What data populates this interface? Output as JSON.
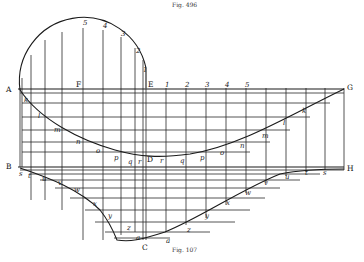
{
  "figure": {
    "caption_top": "Fig. 496",
    "caption_bottom": "Fig. 107",
    "points": {
      "A": "A",
      "B": "B",
      "C": "C",
      "D": "D",
      "E": "E",
      "F": "F",
      "G": "G",
      "H": "H"
    },
    "circle_labels": [
      "5",
      "4",
      "3",
      "2",
      "1"
    ],
    "scale_labels": [
      "1",
      "2",
      "3",
      "4",
      "5"
    ],
    "upper_curve_labels": [
      "k",
      "l",
      "m",
      "n",
      "o",
      "p",
      "q",
      "r",
      "r",
      "q",
      "p",
      "o",
      "n",
      "m",
      "l",
      "k"
    ],
    "lower_curve_labels_left": [
      "s",
      "t",
      "u",
      "v",
      "w",
      "x",
      "y",
      "z",
      "a"
    ],
    "lower_curve_labels_right": [
      "a",
      "z",
      "y",
      "x",
      "w",
      "v",
      "u",
      "t",
      "s"
    ]
  }
}
